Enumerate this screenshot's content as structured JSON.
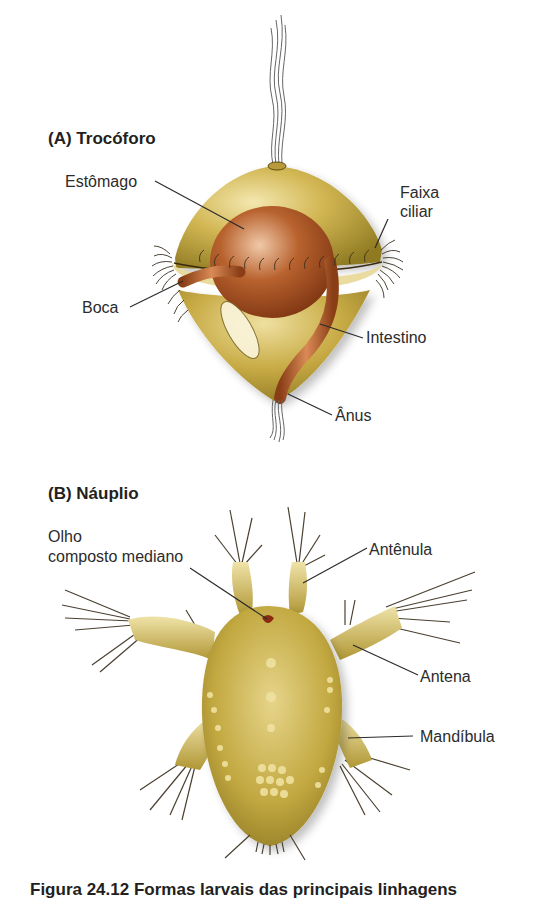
{
  "figure": {
    "panel_a": {
      "title": "(A)  Trocóforo",
      "labels": {
        "estomago": "Estômago",
        "faixa_ciliar_1": "Faixa",
        "faixa_ciliar_2": "ciliar",
        "boca": "Boca",
        "intestino": "Intestino",
        "anus": "Ânus"
      }
    },
    "panel_b": {
      "title": "(B)  Náuplio",
      "labels": {
        "olho_1": "Olho",
        "olho_2": "composto mediano",
        "antenula": "Antênula",
        "antena": "Antena",
        "mandibula": "Mandíbula"
      }
    },
    "caption": "Figura 24.12  Formas larvais das principais linhagens"
  },
  "colors": {
    "body_gold": "#c9ad48",
    "body_light": "#efe1a0",
    "body_dark": "#8f7a22",
    "gut_brown": "#9b4a1e",
    "gut_light": "#d98a55",
    "leader_line": "#2b2b2b"
  }
}
